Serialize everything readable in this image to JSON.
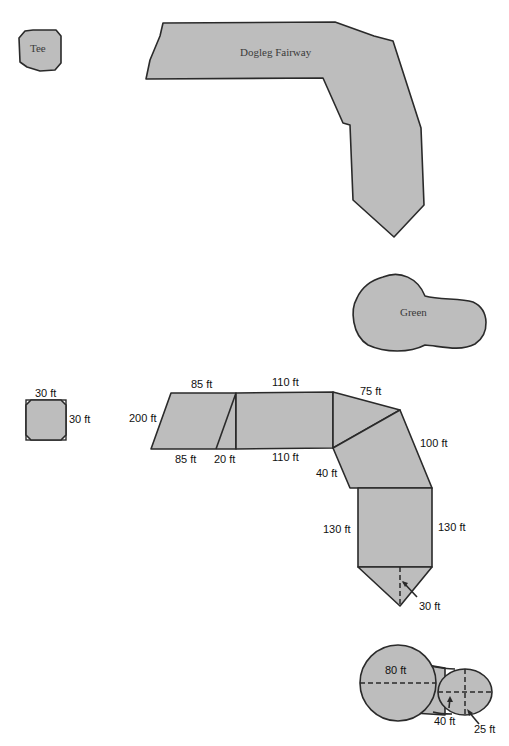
{
  "top_diagram": {
    "tee_label": "Tee",
    "fairway_label": "Dogleg Fairway",
    "green_label": "Green"
  },
  "bottom_diagram": {
    "tee": {
      "top": "30 ft",
      "side": "30 ft"
    },
    "fairway": {
      "left_slant": "200 ft",
      "top_left": "85 ft",
      "bottom_left": "85 ft",
      "bottom_triangle": "20 ft",
      "top_mid": "110 ft",
      "bottom_mid": "110 ft",
      "corner_top": "75 ft",
      "corner_right": "100 ft",
      "corner_inner": "40 ft",
      "lower_left": "130 ft",
      "lower_right": "130 ft",
      "tip_height": "30 ft"
    },
    "green": {
      "big_circle": "80 ft",
      "ellipse_width": "40 ft",
      "ellipse_height": "25 ft"
    }
  },
  "colors": {
    "fill": "#bdbdbd",
    "stroke": "#2a2a2a"
  }
}
